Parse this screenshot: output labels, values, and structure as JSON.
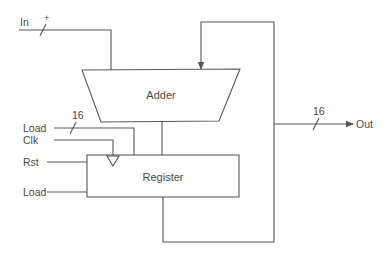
{
  "diagram": {
    "type": "accumulator datapath",
    "blocks": {
      "adder": {
        "label": "Adder"
      },
      "register": {
        "label": "Register"
      }
    },
    "inputs": {
      "in": {
        "label": "In",
        "bus_mark": "+"
      },
      "load_data": {
        "label": "Load",
        "bus_width": "16"
      },
      "clk": {
        "label": "Clk"
      },
      "rst": {
        "label": "Rst"
      },
      "load_ctrl": {
        "label": "Load"
      }
    },
    "outputs": {
      "out": {
        "label": "Out",
        "bus_width": "16"
      }
    },
    "colors": {
      "line": "#555555",
      "text": "#4a4a4a",
      "background": "#ffffff"
    }
  }
}
